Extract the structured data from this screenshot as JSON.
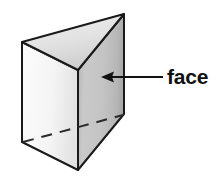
{
  "figure": {
    "kind": "triangular-prism-diagram",
    "background_color": "#ffffff",
    "outline_color": "#1a1a1a",
    "shape": {
      "name": "triangular prism",
      "faces": {
        "top_triangle": {
          "fill_light": "#ededed",
          "fill_dark": "#d2d2d2",
          "points": "22,42 124,14 78,70"
        },
        "left_rectangle": {
          "fill_light": "#fbfbfb",
          "fill_dark": "#e6e6e6",
          "points": "22,42 78,70 78,170 22,142"
        },
        "right_rectangle": {
          "fill_light": "#cfcfcf",
          "fill_dark": "#aeaeae",
          "points": "78,70 124,14 124,114 78,170"
        }
      },
      "hidden_edge": {
        "name": "hidden-bottom-edge",
        "style": "dashed",
        "from": "22,142",
        "to": "124,114"
      }
    },
    "annotation": {
      "label": "face",
      "label_x": 167,
      "label_y": 66,
      "arrow": {
        "name": "leader-arrow",
        "direction": "left",
        "tail_x": 162,
        "tail_y": 77,
        "tip_x": 101,
        "tip_y": 77,
        "color": "#111111"
      }
    }
  }
}
